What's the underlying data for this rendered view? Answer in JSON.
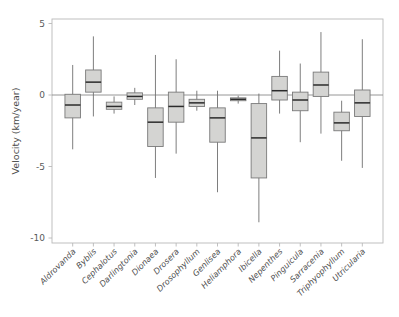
{
  "chart_data": {
    "type": "box",
    "title": "",
    "xlabel": "",
    "ylabel": "Velocity (km/year)",
    "ylim": [
      -11.5,
      6.2
    ],
    "yticks": [
      5,
      0,
      -5,
      -10
    ],
    "ytick_labels": [
      "5",
      "0",
      "-5",
      "-10"
    ],
    "grid": false,
    "legend": null,
    "zero_reference_line": 0,
    "categories": [
      "Aldrovanda",
      "Byblis",
      "Cephalotus",
      "Darlingtonia",
      "Dionaea",
      "Drosera",
      "Drosophyllum",
      "Genlisea",
      "Heliamphora",
      "Ibicella",
      "Nepenthes",
      "Pinguicula",
      "Sarracenia",
      "Triphyophyllum",
      "Utricularia"
    ],
    "boxes": [
      {
        "category": "Aldrovanda",
        "whisker_low": -3.8,
        "q1": -1.6,
        "median": -0.7,
        "q3": 0.05,
        "whisker_high": 2.1
      },
      {
        "category": "Byblis",
        "whisker_low": -1.5,
        "q1": 0.2,
        "median": 0.9,
        "q3": 1.75,
        "whisker_high": 4.1
      },
      {
        "category": "Cephalotus",
        "whisker_low": -1.3,
        "q1": -1.0,
        "median": -0.8,
        "q3": -0.5,
        "whisker_high": -0.1
      },
      {
        "category": "Darlingtonia",
        "whisker_low": -0.7,
        "q1": -0.3,
        "median": -0.1,
        "q3": 0.15,
        "whisker_high": 0.5
      },
      {
        "category": "Dionaea",
        "whisker_low": -5.8,
        "q1": -3.6,
        "median": -1.9,
        "q3": -0.9,
        "whisker_high": 2.8
      },
      {
        "category": "Drosera",
        "whisker_low": -4.1,
        "q1": -1.9,
        "median": -0.8,
        "q3": 0.2,
        "whisker_high": 2.5
      },
      {
        "category": "Drosophyllum",
        "whisker_low": -1.1,
        "q1": -0.8,
        "median": -0.55,
        "q3": -0.3,
        "whisker_high": 0.3
      },
      {
        "category": "Genlisea",
        "whisker_low": -6.8,
        "q1": -3.3,
        "median": -1.6,
        "q3": -0.9,
        "whisker_high": 0.3
      },
      {
        "category": "Heliamphora",
        "whisker_low": -0.6,
        "q1": -0.4,
        "median": -0.3,
        "q3": -0.2,
        "whisker_high": -0.05
      },
      {
        "category": "Ibicella",
        "whisker_low": -8.9,
        "q1": -5.8,
        "median": -3.0,
        "q3": -0.6,
        "whisker_high": 0.1
      },
      {
        "category": "Nepenthes",
        "whisker_low": -1.3,
        "q1": -0.35,
        "median": 0.3,
        "q3": 1.3,
        "whisker_high": 3.1
      },
      {
        "category": "Pinguicula",
        "whisker_low": -3.3,
        "q1": -1.1,
        "median": -0.35,
        "q3": 0.2,
        "whisker_high": 2.2
      },
      {
        "category": "Sarracenia",
        "whisker_low": -2.7,
        "q1": -0.1,
        "median": 0.7,
        "q3": 1.6,
        "whisker_high": 4.4
      },
      {
        "category": "Triphyophyllum",
        "whisker_low": -4.6,
        "q1": -2.5,
        "median": -1.95,
        "q3": -1.2,
        "whisker_high": -0.4
      },
      {
        "category": "Utricularia",
        "whisker_low": -5.1,
        "q1": -1.5,
        "median": -0.55,
        "q3": 0.35,
        "whisker_high": 3.9
      }
    ],
    "colors": {
      "box_fill": "#d4d4d2",
      "box_edge": "#7a7a7a",
      "median": "#2b2b2b",
      "whisker": "#6f6f6f",
      "axis": "#b9b9b9",
      "zero_line": "#8a8a8a",
      "text": "#4f4f4f",
      "background": "#ffffff"
    }
  }
}
